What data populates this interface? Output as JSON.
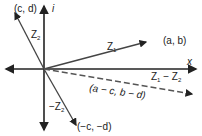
{
  "diagram": {
    "axes": {
      "x_label": "x",
      "y_label": "i"
    },
    "vectors": [
      {
        "name": "Z",
        "sub": "1",
        "point_label": "(a, b)"
      },
      {
        "name": "Z",
        "sub": "2",
        "point_label": "(c, d)"
      },
      {
        "name": "−Z",
        "sub": "2",
        "point_label": "(−c, −d)"
      },
      {
        "name": "Z",
        "sub": "1",
        "minus": " − Z",
        "sub2": "2",
        "point_label": "(a − c, b − d)",
        "style": "dashed"
      }
    ],
    "colors": {
      "line": "#444444",
      "text": "#222222"
    }
  }
}
